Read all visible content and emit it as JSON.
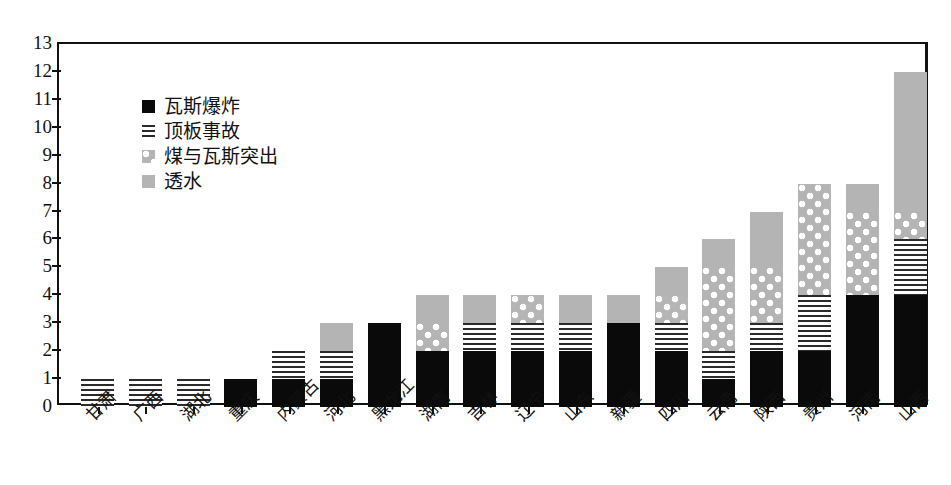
{
  "chart_data": {
    "type": "bar",
    "title": "",
    "subtitle": "",
    "xlabel": "",
    "ylabel": "",
    "stacked": true,
    "grid": false,
    "legend_position": "inside-top-left",
    "ylim": [
      0,
      13
    ],
    "ytick_step": 1,
    "yticks": [
      "13",
      "12",
      "11",
      "10",
      "9",
      "8",
      "7",
      "6",
      "5",
      "4",
      "3",
      "2",
      "1",
      "0"
    ],
    "categories": [
      "甘肃",
      "广西",
      "湖北",
      "重庆",
      "内蒙古",
      "河北",
      "黑龙江",
      "湖南",
      "吉林",
      "辽宁",
      "山东",
      "新疆",
      "四川",
      "云南",
      "陕西",
      "贵州",
      "河南",
      "山西"
    ],
    "series": [
      {
        "name": "瓦斯爆炸",
        "pattern": "solid-black",
        "color": "#0a0a0a",
        "values": [
          0,
          0,
          0,
          1,
          1,
          1,
          3,
          2,
          2,
          2,
          2,
          3,
          2,
          1,
          2,
          2,
          4,
          4
        ]
      },
      {
        "name": "顶板事故",
        "pattern": "horizontal-stripes",
        "color": "#2a2a2a",
        "values": [
          1,
          1,
          1,
          0,
          1,
          1,
          0,
          0,
          1,
          1,
          1,
          0,
          1,
          1,
          1,
          2,
          0,
          2
        ]
      },
      {
        "name": "煤与瓦斯突出",
        "pattern": "dots-on-gray",
        "color": "#b4b4b4",
        "values": [
          0,
          0,
          0,
          0,
          0,
          0,
          0,
          1,
          0,
          1,
          0,
          0,
          1,
          3,
          2,
          4,
          3,
          1
        ]
      },
      {
        "name": "透水",
        "pattern": "solid-gray",
        "color": "#b4b4b4",
        "values": [
          0,
          0,
          0,
          0,
          0,
          1,
          0,
          1,
          1,
          0,
          1,
          1,
          1,
          1,
          2,
          0,
          1,
          5
        ]
      }
    ],
    "totals": [
      1,
      1,
      1,
      1,
      2,
      3,
      3,
      4,
      4,
      4,
      4,
      4,
      5,
      6,
      7,
      8,
      8,
      12
    ]
  },
  "legend": {
    "items": [
      {
        "label": "瓦斯爆炸"
      },
      {
        "label": "顶板事故"
      },
      {
        "label": "煤与瓦斯突出"
      },
      {
        "label": "透水"
      }
    ]
  }
}
